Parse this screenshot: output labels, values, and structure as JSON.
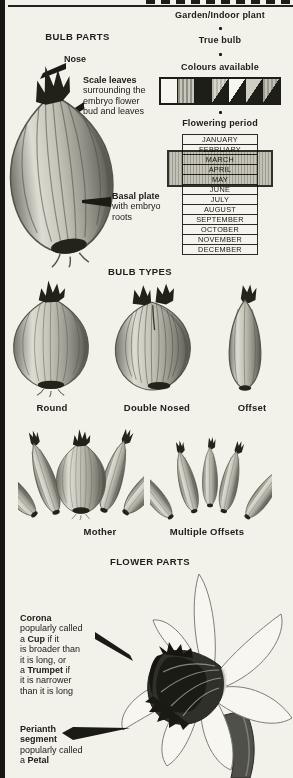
{
  "taxonomy": {
    "garden_indoor": "Garden/Indoor plant",
    "true_bulb": "True bulb"
  },
  "colours": {
    "title": "Colours available",
    "swatches": [
      {
        "name": "white",
        "type": "solid",
        "c1": "#f6f5ef"
      },
      {
        "name": "hatched-grey",
        "type": "stripes",
        "c1": "#8f8f85",
        "c2": "#c8c7bc"
      },
      {
        "name": "black",
        "type": "solid",
        "c1": "#1e1e18"
      },
      {
        "name": "split-hatched-black",
        "type": "split",
        "stripes": true,
        "c1": "#b7b6ab",
        "sc": "#d8d7cc",
        "c2": "#1e1e18"
      },
      {
        "name": "split-white-black",
        "type": "split",
        "c1": "#f6f5ef",
        "c2": "#1e1e18"
      },
      {
        "name": "split-grey-black",
        "type": "split",
        "c1": "#cfcec3",
        "c2": "#1e1e18"
      },
      {
        "name": "split-hatched-black-2",
        "type": "split",
        "stripes": true,
        "c1": "#9b9b90",
        "sc": "#c2c1b6",
        "c2": "#1e1e18"
      }
    ]
  },
  "flowering": {
    "title": "Flowering period",
    "months": [
      "JANUARY",
      "FEBRUARY",
      "MARCH",
      "APRIL",
      "MAY",
      "JUNE",
      "JULY",
      "AUGUST",
      "SEPTEMBER",
      "OCTOBER",
      "NOVEMBER",
      "DECEMBER"
    ],
    "highlight_from": "FEBRUARY",
    "highlight_to": "MAY"
  },
  "bulb_parts": {
    "title": "BULB PARTS",
    "nose": "Nose",
    "scale_leaves": [
      [
        [
          "Scale leaves",
          true
        ]
      ],
      [
        [
          "surrounding the",
          false
        ]
      ],
      [
        [
          "embryo flower",
          false
        ]
      ],
      [
        [
          "bud and leaves",
          false
        ]
      ]
    ],
    "basal_plate": [
      [
        [
          "Basal plate",
          true
        ]
      ],
      [
        [
          "with embryo",
          false
        ]
      ],
      [
        [
          "roots",
          false
        ]
      ]
    ]
  },
  "bulb_types": {
    "title": "BULB TYPES",
    "round": "Round",
    "double_nosed": "Double Nosed",
    "offset": "Offset",
    "mother": "Mother",
    "multiple_offsets": "Multiple Offsets"
  },
  "flower_parts": {
    "title": "FLOWER PARTS",
    "corona": [
      [
        [
          "Corona",
          true
        ]
      ],
      [
        [
          "popularly called",
          false
        ]
      ],
      [
        [
          "a ",
          false
        ],
        [
          "Cup",
          true
        ],
        [
          " if it",
          false
        ]
      ],
      [
        [
          "is broader than",
          false
        ]
      ],
      [
        [
          "it is long, or",
          false
        ]
      ],
      [
        [
          "a ",
          false
        ],
        [
          "Trumpet",
          true
        ],
        [
          " if",
          false
        ]
      ],
      [
        [
          "it is narrower",
          false
        ]
      ],
      [
        [
          "than it is long",
          false
        ]
      ]
    ],
    "perianth": [
      [
        [
          "Perianth",
          true
        ]
      ],
      [
        [
          "segment",
          true
        ]
      ],
      [
        [
          "popularly called",
          false
        ]
      ],
      [
        [
          "a ",
          false
        ],
        [
          "Petal",
          true
        ]
      ]
    ]
  }
}
